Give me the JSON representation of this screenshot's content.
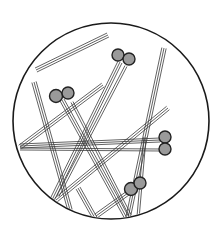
{
  "figure": {
    "circle": {
      "cx": 111,
      "cy": 121,
      "r": 98,
      "stroke": "#1a1a1a",
      "fill": "#ffffff"
    },
    "colors": {
      "needle": "#3a3a3a",
      "sphere_fill": "#9a9a9a",
      "sphere_stroke": "#222222",
      "background": "#ffffff"
    },
    "needle_bundles": [
      {
        "x1": 36,
        "y1": 70,
        "x2": 108,
        "y2": 35,
        "lines": 3,
        "gap": 2.2
      },
      {
        "x1": 34,
        "y1": 82,
        "x2": 70,
        "y2": 210,
        "lines": 3,
        "gap": 2.2
      },
      {
        "x1": 62,
        "y1": 100,
        "x2": 128,
        "y2": 220,
        "lines": 3,
        "gap": 2.2
      },
      {
        "x1": 52,
        "y1": 200,
        "x2": 120,
        "y2": 62,
        "lines": 3,
        "gap": 2.2
      },
      {
        "x1": 58,
        "y1": 196,
        "x2": 126,
        "y2": 66,
        "lines": 2,
        "gap": 2.2
      },
      {
        "x1": 20,
        "y1": 147,
        "x2": 103,
        "y2": 85,
        "lines": 3,
        "gap": 2.2
      },
      {
        "x1": 20,
        "y1": 146,
        "x2": 160,
        "y2": 140,
        "lines": 3,
        "gap": 2.0
      },
      {
        "x1": 20,
        "y1": 149,
        "x2": 160,
        "y2": 150,
        "lines": 2,
        "gap": 2.0
      },
      {
        "x1": 164,
        "y1": 48,
        "x2": 128,
        "y2": 218,
        "lines": 3,
        "gap": 2.2
      },
      {
        "x1": 168,
        "y1": 108,
        "x2": 56,
        "y2": 200,
        "lines": 3,
        "gap": 2.2
      },
      {
        "x1": 72,
        "y1": 102,
        "x2": 130,
        "y2": 215,
        "lines": 2,
        "gap": 2.2
      },
      {
        "x1": 78,
        "y1": 188,
        "x2": 96,
        "y2": 220,
        "lines": 3,
        "gap": 2.2
      },
      {
        "x1": 96,
        "y1": 216,
        "x2": 135,
        "y2": 188,
        "lines": 3,
        "gap": 2.2
      },
      {
        "x1": 145,
        "y1": 137,
        "x2": 138,
        "y2": 218,
        "lines": 2,
        "gap": 2.2
      }
    ],
    "sphere_pairs": [
      {
        "name": "upper-center",
        "spheres": [
          {
            "cx": 118,
            "cy": 55,
            "r": 6
          },
          {
            "cx": 129,
            "cy": 59,
            "r": 6
          }
        ]
      },
      {
        "name": "upper-left",
        "spheres": [
          {
            "cx": 56,
            "cy": 96,
            "r": 6.5
          },
          {
            "cx": 68,
            "cy": 93,
            "r": 6
          }
        ]
      },
      {
        "name": "right",
        "spheres": [
          {
            "cx": 165,
            "cy": 137,
            "r": 6
          },
          {
            "cx": 165,
            "cy": 149,
            "r": 6
          }
        ]
      },
      {
        "name": "lower-right",
        "spheres": [
          {
            "cx": 131,
            "cy": 189,
            "r": 6.5
          },
          {
            "cx": 140,
            "cy": 183,
            "r": 6
          }
        ]
      }
    ]
  }
}
